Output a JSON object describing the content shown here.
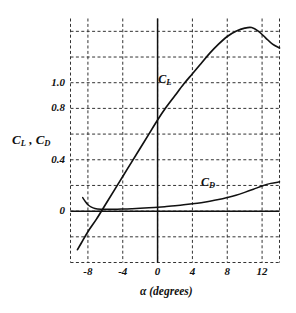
{
  "chart_data": {
    "type": "line",
    "title": "",
    "xlabel": "α (degrees)",
    "ylabel": "Cₗ , Cₒ",
    "ylabel_main": "C",
    "ylabel_sub1": "L",
    "ylabel_sub2": "D",
    "ylabel_sep": " , ",
    "xlim": [
      -10,
      14
    ],
    "ylim": [
      -0.4,
      1.5
    ],
    "grid": true,
    "grid_style": "dashed",
    "legend": "inline-annotations",
    "x_ticks": [
      -8,
      -4,
      0,
      4,
      8,
      12
    ],
    "x_tick_labels": [
      "-8",
      "-4",
      "0",
      "4",
      "8",
      "12"
    ],
    "y_ticks": [
      0,
      0.4,
      0.8,
      1.0
    ],
    "y_tick_labels": [
      "0",
      "0.4",
      "0.8",
      "1.0"
    ],
    "y_gridlines": [
      -0.4,
      -0.2,
      0.0,
      0.2,
      0.4,
      0.6,
      0.8,
      1.0,
      1.2,
      1.4
    ],
    "x_gridlines": [
      -10,
      -8,
      -4,
      0,
      4,
      8,
      12,
      14
    ],
    "annotations": [
      {
        "text": "C",
        "sub": "L",
        "x": 1.0,
        "y": 1.02,
        "name": "cl-curve-label"
      },
      {
        "text": "C",
        "sub": "D",
        "x": 5.9,
        "y": 0.22,
        "name": "cd-curve-label"
      }
    ],
    "series": [
      {
        "name": "C_L",
        "label": "Cₗ",
        "color": "#111111",
        "x": [
          -9.2,
          -8.6,
          -8.0,
          -7.0,
          -6.0,
          -5.0,
          -4.0,
          -3.0,
          -2.0,
          -1.0,
          0.0,
          1.0,
          2.0,
          3.0,
          4.0,
          5.0,
          6.0,
          7.0,
          8.0,
          9.0,
          10.0,
          10.8,
          11.6,
          12.4,
          13.2,
          14.0
        ],
        "y": [
          -0.3,
          -0.23,
          -0.16,
          -0.06,
          0.05,
          0.16,
          0.27,
          0.38,
          0.49,
          0.6,
          0.71,
          0.81,
          0.9,
          0.99,
          1.07,
          1.15,
          1.23,
          1.3,
          1.36,
          1.4,
          1.425,
          1.43,
          1.4,
          1.35,
          1.3,
          1.27
        ]
      },
      {
        "name": "C_D",
        "label": "Cₒ",
        "color": "#111111",
        "x": [
          -8.6,
          -8.3,
          -8.0,
          -7.6,
          -7.2,
          -6.5,
          -6.0,
          -5.0,
          -4.0,
          -3.0,
          -2.0,
          -1.0,
          0.0,
          1.0,
          2.0,
          3.0,
          4.0,
          5.0,
          6.0,
          7.0,
          8.0,
          9.0,
          10.0,
          11.0,
          12.0,
          13.0,
          14.0
        ],
        "y": [
          0.105,
          0.075,
          0.05,
          0.031,
          0.021,
          0.015,
          0.014,
          0.014,
          0.016,
          0.019,
          0.022,
          0.026,
          0.031,
          0.036,
          0.042,
          0.049,
          0.057,
          0.066,
          0.077,
          0.09,
          0.106,
          0.124,
          0.146,
          0.17,
          0.196,
          0.216,
          0.228
        ]
      }
    ],
    "axis_lines": {
      "x_axis_at_y": 0.0,
      "y_axis_at_x": 0.0
    }
  },
  "figure": {
    "caption": "",
    "background": "#ffffff",
    "ink_color": "#111111",
    "grid_color": "#333333"
  }
}
